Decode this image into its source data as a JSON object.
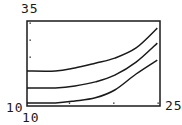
{
  "chart_data": {
    "type": "line",
    "title": "",
    "xlabel": "",
    "ylabel": "",
    "xlim": [
      10,
      25
    ],
    "ylim": [
      10,
      35
    ],
    "grid": false,
    "legend": null,
    "window_labels": {
      "ymax": "35",
      "ymin": "10",
      "xmin": "10",
      "xmax": "25"
    },
    "x_ticks": [
      15,
      20,
      25
    ],
    "y_ticks": [
      25,
      30,
      35
    ],
    "series": [
      {
        "name": "upper curve",
        "x": [
          10,
          13.2,
          15.4,
          17.7,
          19.9,
          22.3,
          24.7
        ],
        "y": [
          20.3,
          20.3,
          21.2,
          22.6,
          24.1,
          27.1,
          32.9
        ]
      },
      {
        "name": "middle curve",
        "x": [
          10,
          13.2,
          15.4,
          17.7,
          19.9,
          22.3,
          24.7
        ],
        "y": [
          15.3,
          15.3,
          15.9,
          17.1,
          19.1,
          22.9,
          28.5
        ]
      },
      {
        "name": "lower curve",
        "x": [
          10,
          13.2,
          15.4,
          17.7,
          19.9,
          22.3,
          24.7
        ],
        "y": [
          10.9,
          10.9,
          11.5,
          12.4,
          14.7,
          19.4,
          23.5
        ]
      }
    ]
  },
  "style": {
    "line_color": "#1a1a1a",
    "frame_color": "#1a1a1a",
    "background": "#ffffff"
  }
}
